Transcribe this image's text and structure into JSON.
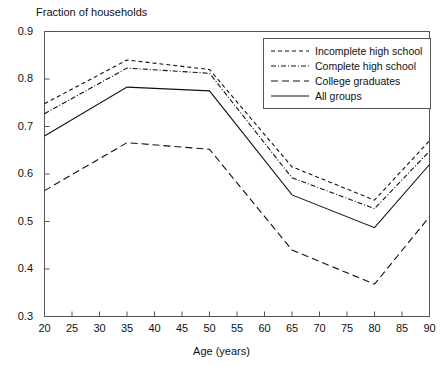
{
  "chart_data": {
    "type": "line",
    "title": "Fraction of households",
    "xlabel": "Age (years)",
    "ylabel": "Fraction of households",
    "xlim": [
      20,
      90
    ],
    "ylim": [
      0.3,
      0.9
    ],
    "grid": false,
    "legend_position": "top-right",
    "x": [
      20,
      35,
      50,
      65,
      80,
      90
    ],
    "xticks": [
      "20",
      "25",
      "30",
      "35",
      "40",
      "45",
      "50",
      "55",
      "60",
      "65",
      "70",
      "75",
      "80",
      "85",
      "90"
    ],
    "xtick_values": [
      20,
      25,
      30,
      35,
      40,
      45,
      50,
      55,
      60,
      65,
      70,
      75,
      80,
      85,
      90
    ],
    "yticks": [
      "0.9",
      "0.8",
      "0.7",
      "0.6",
      "0.5",
      "0.4",
      "0.3"
    ],
    "ytick_values": [
      0.9,
      0.8,
      0.7,
      0.6,
      0.5,
      0.4,
      0.3
    ],
    "series": [
      {
        "name": "Incomplete high school",
        "dash": "short-dash",
        "values": [
          0.748,
          0.84,
          0.82,
          0.615,
          0.545,
          0.67
        ]
      },
      {
        "name": "Complete high school",
        "dash": "dash-dot",
        "values": [
          0.727,
          0.823,
          0.812,
          0.592,
          0.527,
          0.648
        ]
      },
      {
        "name": "College graduates",
        "dash": "long-dash",
        "values": [
          0.565,
          0.666,
          0.652,
          0.44,
          0.368,
          0.51
        ]
      },
      {
        "name": "All groups",
        "dash": "solid",
        "values": [
          0.68,
          0.783,
          0.775,
          0.556,
          0.487,
          0.62
        ]
      }
    ]
  },
  "legend": {
    "items": [
      {
        "label": "Incomplete high school"
      },
      {
        "label": "Complete high school"
      },
      {
        "label": "College graduates"
      },
      {
        "label": "All groups"
      }
    ]
  }
}
